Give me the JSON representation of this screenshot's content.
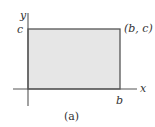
{
  "diagram": {
    "axes": {
      "x_label": "x",
      "y_label": "y",
      "color": "#555555"
    },
    "rectangle": {
      "fill": "#e6e6e6",
      "stroke": "#555555",
      "corner_label": "(b, c)",
      "width_label": "b",
      "height_label": "c"
    },
    "caption": "(a)"
  }
}
